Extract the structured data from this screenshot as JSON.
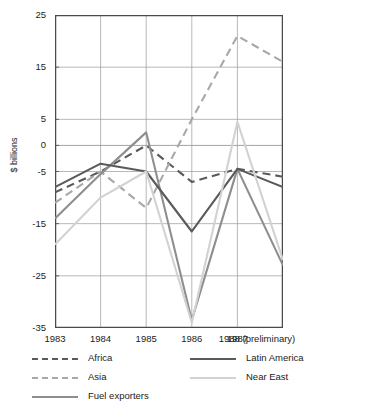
{
  "chart_data": {
    "type": "line",
    "title": "CURRENT ACCOUNT BALANCES 1983-88",
    "xlabel": "",
    "ylabel": "$ billions",
    "categories": [
      "1983",
      "1984",
      "1985",
      "1986",
      "1987",
      "1988 (preliminary)"
    ],
    "x_tick_labels": [
      "1983",
      "1984",
      "1985",
      "1986",
      "1987",
      "1988 (preliminary)"
    ],
    "y_tick_labels": [
      "25",
      "15",
      "5",
      "0",
      "-5",
      "-15",
      "-25",
      "-35"
    ],
    "y_tick_values": [
      25,
      15,
      5,
      0,
      -5,
      -15,
      -25,
      -35
    ],
    "ylim": [
      -35,
      25
    ],
    "grid": true,
    "legend_position": "bottom",
    "series": [
      {
        "name": "Africa",
        "style": "dashed",
        "color": "#5a5a5a",
        "values": [
          -9,
          -5,
          0,
          -7,
          -4.5,
          -6
        ]
      },
      {
        "name": "Asia",
        "style": "dashed",
        "color": "#a8a8a8",
        "values": [
          -11,
          -5,
          -12,
          5,
          21,
          16
        ]
      },
      {
        "name": "Fuel exporters",
        "style": "solid",
        "color": "#8e8e8e",
        "values": [
          -14,
          -5.5,
          2.5,
          -33.5,
          -4.5,
          -23
        ]
      },
      {
        "name": "Latin America",
        "style": "solid",
        "color": "#5a5a5a",
        "values": [
          -8,
          -3.5,
          -5,
          -16.5,
          -4.5,
          -8
        ]
      },
      {
        "name": "Near East",
        "style": "solid",
        "color": "#d2d2d2",
        "values": [
          -19,
          -10,
          -5,
          -34,
          4.5,
          -22
        ]
      }
    ]
  },
  "legend": {
    "items": [
      {
        "label": "Africa",
        "style": "dashed",
        "color": "#5a5a5a"
      },
      {
        "label": "Latin America",
        "style": "solid",
        "color": "#5a5a5a"
      },
      {
        "label": "Asia",
        "style": "dashed",
        "color": "#a8a8a8"
      },
      {
        "label": "Near East",
        "style": "solid",
        "color": "#d2d2d2"
      },
      {
        "label": "Fuel exporters",
        "style": "solid",
        "color": "#8e8e8e"
      }
    ]
  },
  "colors": {
    "axis": "#4a4a4a",
    "grid": "#9a9a9a",
    "text": "#1b1b1b",
    "background": "#ffffff"
  }
}
